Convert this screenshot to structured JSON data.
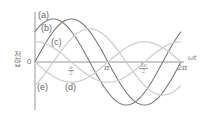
{
  "chart_data": {
    "type": "line",
    "title": "",
    "xlabel": "ωt",
    "ylabel": "전압",
    "origin_label": "0",
    "x_ticks": [
      "π/2",
      "π",
      "3π/2",
      "2π"
    ],
    "x_range": [
      0,
      6.2832
    ],
    "grid": false,
    "legend": "inline labels",
    "series": [
      {
        "name": "(a)",
        "shape": "sine",
        "amplitude": 1.0,
        "phase_rad": 0.785,
        "style": "dark"
      },
      {
        "name": "(b)",
        "shape": "sine",
        "amplitude": 1.0,
        "phase_rad": 0.0,
        "style": "dark"
      },
      {
        "name": "(c)",
        "shape": "sine",
        "amplitude": 0.47,
        "phase_rad": 1.571,
        "style": "light"
      },
      {
        "name": "(d)",
        "shape": "sine",
        "amplitude": 0.47,
        "phase_rad": 3.1416,
        "style": "light"
      },
      {
        "name": "(e)",
        "shape": "sine",
        "amplitude": 0.77,
        "phase_rad": -0.785,
        "style": "light"
      }
    ]
  },
  "labels": {
    "a": "(a)",
    "b": "(b)",
    "c": "(c)",
    "d": "(d)",
    "e": "(e)",
    "origin": "0",
    "xaxis": "ωt",
    "yaxis_line1": "전",
    "yaxis_line2": "압",
    "tick_pi": "π",
    "tick_2pi": "2π",
    "tick_half_num": "π",
    "tick_half_den": "2",
    "tick_3half_num": "3π",
    "tick_3half_den": "2"
  },
  "colors": {
    "dark_curve": "#7a7a7a",
    "light_curve": "#cfcfcf",
    "axis": "#8c8c8c"
  }
}
